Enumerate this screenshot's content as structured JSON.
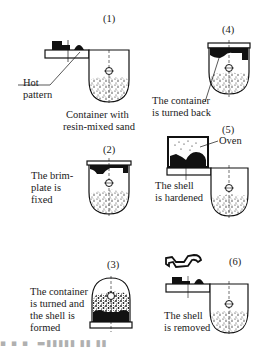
{
  "diagram": {
    "type": "process-steps",
    "steps": [
      {
        "number": "(1)",
        "labels": [
          "Hot",
          "pattern"
        ],
        "caption": [
          "Container with",
          "resin-mixed sand"
        ]
      },
      {
        "number": "(2)",
        "caption": [
          "The brim-",
          "plate is",
          "fixed"
        ]
      },
      {
        "number": "(3)",
        "caption": [
          "The container",
          "is turned and",
          "the shell is",
          "formed"
        ]
      },
      {
        "number": "(4)",
        "caption": [
          "The container",
          "is turned back"
        ]
      },
      {
        "number": "(5)",
        "labels": [
          "Oven"
        ],
        "caption": [
          "The shell",
          "is hardened"
        ]
      },
      {
        "number": "(6)",
        "caption": [
          "The shell",
          "is removed"
        ]
      }
    ],
    "footer_caption_partial": "[ ? ] · ·  (cropped caption)"
  }
}
